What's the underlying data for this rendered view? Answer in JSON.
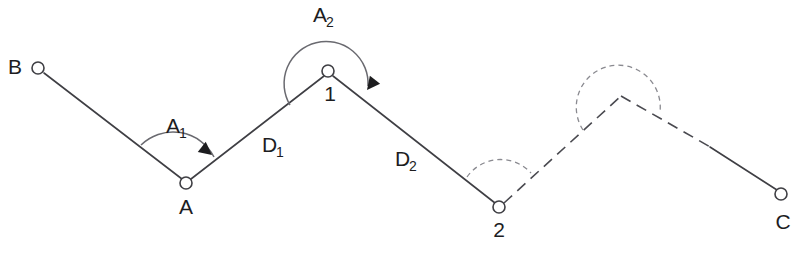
{
  "diagram": {
    "width": 801,
    "height": 253,
    "background_color": "#ffffff",
    "line_color": "#3f3f44",
    "arc_color": "#6a6a70",
    "dashed_arc_color": "#8a8a90",
    "arrow_color": "#1d1d1f",
    "text_color": "#1d1d1f"
  },
  "stations": [
    {
      "id": "B",
      "label": "B",
      "label_sub": "",
      "x": 38,
      "y": 68,
      "marker": "open-circle",
      "radius": 6,
      "label_x": 15,
      "label_y": 74
    },
    {
      "id": "A",
      "label": "A",
      "label_sub": "",
      "x": 186,
      "y": 183,
      "marker": "open-circle",
      "radius": 6,
      "label_x": 186,
      "label_y": 214
    },
    {
      "id": "1",
      "label": "1",
      "label_sub": "",
      "x": 328,
      "y": 71,
      "marker": "open-circle",
      "radius": 6,
      "label_x": 330,
      "label_y": 101
    },
    {
      "id": "2",
      "label": "2",
      "label_sub": "",
      "x": 499,
      "y": 207,
      "marker": "open-circle",
      "radius": 6,
      "label_x": 499,
      "label_y": 237
    },
    {
      "id": "3",
      "label": "",
      "label_sub": "",
      "x": 621,
      "y": 96,
      "marker": "none",
      "radius": 0,
      "label_x": 621,
      "label_y": 96
    },
    {
      "id": "C",
      "label": "C",
      "label_sub": "",
      "x": 781,
      "y": 194,
      "marker": "open-circle",
      "radius": 6,
      "label_x": 783,
      "label_y": 229
    }
  ],
  "segments": [
    {
      "id": "B-A",
      "from": "B",
      "to": "A",
      "style": "solid",
      "x1": 44,
      "y1": 73,
      "x2": 182,
      "y2": 179
    },
    {
      "id": "A-1",
      "from": "A",
      "to": "1",
      "style": "solid",
      "x1": 191,
      "y1": 179,
      "x2": 324,
      "y2": 76
    },
    {
      "id": "1-2",
      "from": "1",
      "to": "2",
      "style": "solid",
      "x1": 333,
      "y1": 76,
      "x2": 495,
      "y2": 203
    },
    {
      "id": "2-3",
      "from": "2",
      "to": "3",
      "style": "dashed",
      "x1": 504,
      "y1": 203,
      "x2": 621,
      "y2": 96
    },
    {
      "id": "3-C-dashed",
      "from": "3",
      "to": "C",
      "style": "dashed",
      "x1": 621,
      "y1": 96,
      "x2": 712,
      "y2": 148
    },
    {
      "id": "3-C-solid",
      "from": "3",
      "to": "C",
      "style": "solid",
      "x1": 710,
      "y1": 147,
      "x2": 777,
      "y2": 190
    }
  ],
  "angles": [
    {
      "id": "A1",
      "label": "A",
      "label_sub": "1",
      "at_station": "A",
      "style": "solid",
      "has_arrow": true,
      "path": "M 141 145 A 46 46 0 0 1 214 157",
      "label_x": 166,
      "label_y": 133,
      "sub_dx": 13,
      "sub_dy": 5,
      "arrow_x": 212,
      "arrow_y": 155,
      "arrow_rotate": 38
    },
    {
      "id": "A2",
      "label": "A",
      "label_sub": "2",
      "at_station": "1",
      "style": "solid",
      "has_arrow": true,
      "path": "M 290 105 A 42 42 0 1 1 368 86",
      "label_x": 313,
      "label_y": 22,
      "sub_dx": 13,
      "sub_dy": 5,
      "arrow_x": 367,
      "arrow_y": 90,
      "arrow_rotate": 128
    },
    {
      "id": "angle-at-2",
      "label": "",
      "label_sub": "",
      "at_station": "2",
      "style": "dashed",
      "has_arrow": false,
      "path": "M 467 177 A 41 41 0 0 1 531 173",
      "label_x": 0,
      "label_y": 0,
      "sub_dx": 0,
      "sub_dy": 0,
      "arrow_x": 0,
      "arrow_y": 0,
      "arrow_rotate": 0
    },
    {
      "id": "angle-at-3",
      "label": "",
      "label_sub": "",
      "at_station": "3",
      "style": "dashed",
      "has_arrow": false,
      "path": "M 583 130 A 42 42 0 1 1 660 112",
      "label_x": 0,
      "label_y": 0,
      "sub_dx": 0,
      "sub_dy": 0,
      "arrow_x": 0,
      "arrow_y": 0,
      "arrow_rotate": 0
    }
  ],
  "distances": [
    {
      "id": "D1",
      "label": "D",
      "label_sub": "1",
      "segment": "A-1",
      "label_x": 262,
      "label_y": 152,
      "sub_dx": 14,
      "sub_dy": 5
    },
    {
      "id": "D2",
      "label": "D",
      "label_sub": "2",
      "segment": "1-2",
      "label_x": 395,
      "label_y": 166,
      "sub_dx": 14,
      "sub_dy": 5
    }
  ]
}
